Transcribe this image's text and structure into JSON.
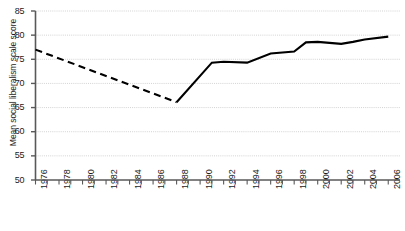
{
  "chart_data": {
    "type": "line",
    "title": "",
    "xlabel": "",
    "ylabel": "Mean social liberalism scale score",
    "ylim": [
      50,
      85
    ],
    "ytick_labels": [
      "50",
      "55",
      "60",
      "65",
      "70",
      "75",
      "80",
      "85"
    ],
    "yticks": [
      50,
      55,
      60,
      65,
      70,
      75,
      80,
      85
    ],
    "xlim": [
      1976,
      2007
    ],
    "xtick_labels": [
      "1976",
      "1978",
      "1980",
      "1982",
      "1984",
      "1986",
      "1988",
      "1990",
      "1992",
      "1994",
      "1996",
      "1998",
      "2000",
      "2002",
      "2004",
      "2006"
    ],
    "xticks": [
      1976,
      1978,
      1980,
      1982,
      1984,
      1986,
      1988,
      1990,
      1992,
      1994,
      1996,
      1998,
      2000,
      2002,
      2004,
      2006
    ],
    "grid": true,
    "grid_axis": "y",
    "legend": "none",
    "line_color": "#000000",
    "grid_color": "#c8c8c8",
    "axis_color": "#595959",
    "series": [
      {
        "name": "Mean social liberalism scale score",
        "style": "dashed",
        "note": "interpolated / estimated period",
        "x": [
          1976,
          1988
        ],
        "values": [
          77.0,
          66.1
        ]
      },
      {
        "name": "Mean social liberalism scale score",
        "style": "solid",
        "note": "observed period",
        "x": [
          1988,
          1991,
          1992,
          1994,
          1996,
          1998,
          1999,
          2000,
          2002,
          2003,
          2004,
          2006
        ],
        "values": [
          66.1,
          74.3,
          74.5,
          74.3,
          76.2,
          76.6,
          78.5,
          78.6,
          78.2,
          78.6,
          79.1,
          79.7
        ]
      }
    ]
  },
  "axes": {
    "y_axis_name": "y-axis",
    "x_axis_name": "x-axis"
  }
}
